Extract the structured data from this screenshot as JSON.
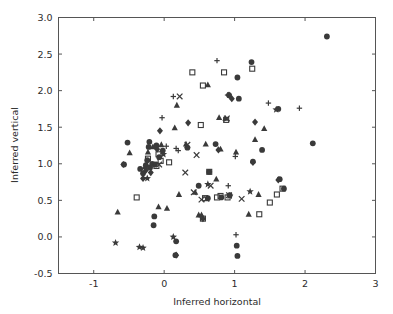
{
  "chart_data": {
    "type": "scatter",
    "title": "",
    "xlabel": "Inferred horizontal",
    "ylabel": "Inferred vertical",
    "xlim": [
      -1.5,
      3.0
    ],
    "ylim": [
      -0.5,
      3.0
    ],
    "xticks": [
      "-1",
      "0",
      "1",
      "2",
      "3"
    ],
    "xtick_values": [
      -1,
      0,
      1,
      2,
      3
    ],
    "yticks": [
      "-0.5",
      "0.0",
      "0.5",
      "1.0",
      "1.5",
      "2.0",
      "2.5",
      "3.0"
    ],
    "ytick_values": [
      -0.5,
      0.0,
      0.5,
      1.0,
      1.5,
      2.0,
      2.5,
      3.0
    ],
    "grid": false,
    "legend": "none",
    "marker_color": "#3a3a3a",
    "marker_shapes": [
      "circle",
      "square",
      "triangle",
      "diamond",
      "x",
      "plus",
      "star"
    ],
    "series": [
      {
        "name": "circle",
        "marker": "circle",
        "points": [
          [
            2.31,
            2.74
          ],
          [
            1.24,
            2.39
          ],
          [
            1.04,
            2.18
          ],
          [
            0.92,
            1.94
          ],
          [
            1.06,
            1.89
          ],
          [
            1.62,
            1.75
          ],
          [
            2.11,
            1.28
          ],
          [
            -0.52,
            1.29
          ],
          [
            0.73,
            1.27
          ],
          [
            -0.11,
            1.25
          ],
          [
            1.26,
            1.03
          ],
          [
            1.39,
            1.19
          ],
          [
            -0.57,
            0.99
          ],
          [
            -0.26,
            0.98
          ],
          [
            -0.2,
            0.95
          ],
          [
            -0.17,
            1.0
          ],
          [
            -0.13,
            0.99
          ],
          [
            -0.24,
            1.05
          ],
          [
            -0.3,
            0.87
          ],
          [
            -0.34,
            0.93
          ],
          [
            0.64,
            0.89
          ],
          [
            0.62,
            0.53
          ],
          [
            1.7,
            0.66
          ],
          [
            1.64,
            0.79
          ],
          [
            0.93,
            0.57
          ],
          [
            -0.14,
            0.28
          ],
          [
            -0.15,
            0.16
          ],
          [
            0.17,
            -0.06
          ],
          [
            0.16,
            -0.25
          ],
          [
            1.03,
            -0.12
          ],
          [
            1.04,
            -0.26
          ],
          [
            0.49,
            0.7
          ],
          [
            0.33,
            1.22
          ],
          [
            -0.02,
            1.18
          ],
          [
            -0.07,
            1.09
          ],
          [
            -0.22,
            1.23
          ],
          [
            -0.21,
            1.3
          ],
          [
            0.81,
            0.54
          ]
        ]
      },
      {
        "name": "square",
        "marker": "square",
        "points": [
          [
            1.25,
            2.3
          ],
          [
            0.55,
            2.07
          ],
          [
            0.4,
            2.25
          ],
          [
            0.85,
            2.25
          ],
          [
            0.88,
            1.6
          ],
          [
            0.52,
            1.53
          ],
          [
            -0.08,
            1.13
          ],
          [
            -0.05,
            1.04
          ],
          [
            -0.23,
            1.07
          ],
          [
            -0.11,
            0.97
          ],
          [
            0.07,
            1.02
          ],
          [
            0.64,
            0.89
          ],
          [
            0.8,
            0.56
          ],
          [
            0.9,
            0.54
          ],
          [
            1.68,
            0.66
          ],
          [
            1.5,
            0.47
          ],
          [
            1.6,
            0.58
          ],
          [
            0.55,
            0.25
          ],
          [
            -0.39,
            0.54
          ],
          [
            0.75,
            0.54
          ],
          [
            0.58,
            0.53
          ],
          [
            1.35,
            0.31
          ]
        ]
      },
      {
        "name": "triangle",
        "marker": "triangle",
        "points": [
          [
            0.62,
            2.08
          ],
          [
            0.18,
            1.8
          ],
          [
            0.78,
            1.63
          ],
          [
            1.42,
            1.48
          ],
          [
            1.29,
            1.33
          ],
          [
            0.59,
            1.27
          ],
          [
            0.31,
            1.27
          ],
          [
            0.8,
            1.2
          ],
          [
            1.02,
            1.16
          ],
          [
            -0.49,
            1.15
          ],
          [
            -0.23,
            1.16
          ],
          [
            0.15,
            1.49
          ],
          [
            -0.16,
            1.23
          ],
          [
            0.74,
            0.79
          ],
          [
            0.21,
            0.58
          ],
          [
            -0.08,
            0.41
          ],
          [
            0.04,
            0.39
          ],
          [
            -0.66,
            0.34
          ],
          [
            0.49,
            0.3
          ],
          [
            0.53,
            0.3
          ],
          [
            1.2,
            0.31
          ],
          [
            1.34,
            0.58
          ],
          [
            -0.27,
            0.96
          ],
          [
            0.87,
            1.62
          ],
          [
            -0.04,
            1.26
          ],
          [
            0.44,
            0.61
          ]
        ]
      },
      {
        "name": "diamond",
        "marker": "diamond",
        "points": [
          [
            0.34,
            1.56
          ],
          [
            -0.06,
            1.45
          ],
          [
            -0.58,
            0.99
          ],
          [
            -0.3,
            0.8
          ],
          [
            1.29,
            1.57
          ],
          [
            1.26,
            1.02
          ],
          [
            0.96,
            1.89
          ],
          [
            0.77,
            1.19
          ],
          [
            0.17,
            -0.25
          ],
          [
            0.55,
            0.25
          ],
          [
            1.62,
            0.78
          ],
          [
            -0.26,
            0.91
          ],
          [
            -0.19,
            0.88
          ],
          [
            -0.1,
            1.2
          ],
          [
            0.92,
            1.94
          ]
        ]
      },
      {
        "name": "x",
        "marker": "x",
        "points": [
          [
            0.22,
            1.92
          ],
          [
            0.89,
            1.62
          ],
          [
            0.46,
            1.12
          ],
          [
            0.3,
            0.88
          ],
          [
            0.42,
            0.61
          ],
          [
            0.53,
            0.51
          ],
          [
            0.6,
            0.52
          ],
          [
            1.1,
            0.52
          ],
          [
            0.92,
            0.57
          ],
          [
            0.33,
            1.26
          ],
          [
            0.66,
            0.7
          ],
          [
            -0.07,
            0.99
          ]
        ]
      },
      {
        "name": "plus",
        "marker": "plus",
        "points": [
          [
            0.75,
            2.41
          ],
          [
            0.13,
            1.92
          ],
          [
            -0.03,
            1.63
          ],
          [
            0.9,
            1.94
          ],
          [
            1.48,
            1.83
          ],
          [
            1.92,
            1.76
          ],
          [
            1.01,
            1.1
          ],
          [
            0.2,
            1.18
          ],
          [
            0.03,
            1.24
          ],
          [
            1.02,
            0.03
          ],
          [
            0.91,
            0.7
          ],
          [
            0.17,
            1.21
          ]
        ]
      },
      {
        "name": "star",
        "marker": "star",
        "points": [
          [
            1.59,
            1.74
          ],
          [
            0.62,
            0.72
          ],
          [
            -0.24,
            0.8
          ],
          [
            -0.69,
            -0.08
          ],
          [
            -0.35,
            -0.14
          ],
          [
            -0.3,
            -0.15
          ],
          [
            0.13,
            0.0
          ],
          [
            1.22,
            0.62
          ],
          [
            -0.01,
            1.13
          ],
          [
            0.93,
            0.56
          ]
        ]
      }
    ]
  }
}
